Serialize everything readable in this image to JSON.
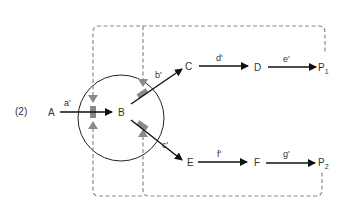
{
  "figure_label": "(2)",
  "colors": {
    "arrow": "#111111",
    "text": "#333333",
    "feedback": "#8a8a8a",
    "circle": "#222222"
  },
  "nodes": {
    "A": "A",
    "B": "B",
    "C": "C",
    "D": "D",
    "E": "E",
    "F": "F",
    "P1": {
      "base": "P",
      "sub": "1"
    },
    "P2": {
      "base": "P",
      "sub": "2"
    }
  },
  "edges": {
    "a": "a'",
    "b": "b'",
    "c": "c'",
    "d": "d'",
    "e": "e'",
    "f": "f'",
    "g": "g'"
  },
  "feedback_loops": [
    {
      "from": "P1",
      "to": [
        "a",
        "b"
      ],
      "style": "dashed",
      "label": "P1 feedback inhibition"
    },
    {
      "from": "P2",
      "to": [
        "a",
        "c"
      ],
      "style": "dashed",
      "label": "P2 feedback inhibition"
    }
  ]
}
